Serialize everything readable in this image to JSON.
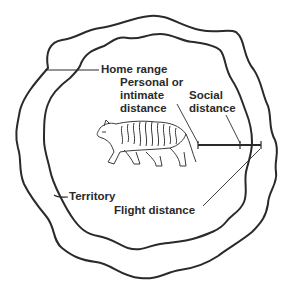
{
  "diagram": {
    "colors": {
      "line": "#2a2a2a",
      "background": "#ffffff",
      "text": "#2a2a2a"
    },
    "labels": {
      "home_range": "Home range",
      "personal_distance_line1": "Personal or",
      "personal_distance_line2": "intimate",
      "personal_distance_line3": "distance",
      "social_distance_line1": "Social",
      "social_distance_line2": "distance",
      "territory": "Territory",
      "flight_distance": "Flight distance"
    }
  }
}
